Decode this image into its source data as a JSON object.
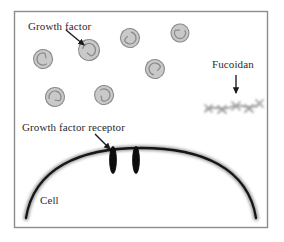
{
  "figure": {
    "frame": {
      "border_color": "#8c8c8c",
      "background_color": "#ffffff",
      "x": 14,
      "y": 11,
      "width": 254,
      "height": 217
    },
    "labels": {
      "growth_factor": "Growth factor",
      "fucoidan": "Fucoidan",
      "growth_factor_receptor": "Growth factor receptor",
      "cell": "Cell"
    },
    "colors": {
      "label_text": "#2b2b2b",
      "arrow": "#1a1a1a",
      "growth_factor_fill": "#c9c9c9",
      "growth_factor_stroke": "#8f8f8f",
      "membrane": "#1b1b1b",
      "receptor": "#111111",
      "fucoidan_chain": "#9a9a9a",
      "frame_border": "#8c8c8c"
    },
    "growth_factors": [
      {
        "id": "gf-1",
        "cx": 43,
        "cy": 59,
        "r": 9.5,
        "rotation": 20
      },
      {
        "id": "gf-2",
        "cx": 89,
        "cy": 50,
        "r": 10.5,
        "rotation": 160
      },
      {
        "id": "gf-3",
        "cx": 130,
        "cy": 38,
        "r": 9.5,
        "rotation": 250
      },
      {
        "id": "gf-4",
        "cx": 180,
        "cy": 33,
        "r": 9.0,
        "rotation": 300
      },
      {
        "id": "gf-5",
        "cx": 155,
        "cy": 69,
        "r": 9.5,
        "rotation": 70
      },
      {
        "id": "gf-6",
        "cx": 55,
        "cy": 97,
        "r": 9.5,
        "rotation": 130
      },
      {
        "id": "gf-7",
        "cx": 104,
        "cy": 95,
        "r": 9.5,
        "rotation": 200
      }
    ],
    "receptors": [
      {
        "id": "receptor-left",
        "cx": 113,
        "cy": 160,
        "rx": 3.2,
        "ry": 13
      },
      {
        "id": "receptor-right",
        "cx": 136,
        "cy": 160,
        "rx": 3.2,
        "ry": 13
      }
    ],
    "arrows": [
      {
        "id": "arrow-growth-factor",
        "x1": 66,
        "y1": 30,
        "x2": 85,
        "y2": 46
      },
      {
        "id": "arrow-fucoidan",
        "x1": 236,
        "y1": 75,
        "x2": 236,
        "y2": 95
      },
      {
        "id": "arrow-receptor",
        "x1": 95,
        "y1": 134,
        "x2": 111,
        "y2": 151
      }
    ],
    "membrane": {
      "id": "cell-membrane",
      "path": "M 26 218 C 34 168, 80 148, 141 148 C 202 148, 248 168, 256 218"
    },
    "fucoidan_chain": {
      "id": "fucoidan-molecule",
      "backbone": "M 206 110 C 214 104, 222 112, 231 107 C 240 102, 248 111, 258 105",
      "nodes": [
        {
          "x": 209,
          "y": 108
        },
        {
          "x": 222,
          "y": 110
        },
        {
          "x": 236,
          "y": 106
        },
        {
          "x": 249,
          "y": 109
        },
        {
          "x": 259,
          "y": 104
        }
      ]
    },
    "label_positions": {
      "growth_factor": {
        "x": 28,
        "y": 30
      },
      "fucoidan": {
        "x": 212,
        "y": 68
      },
      "growth_factor_receptor": {
        "x": 22,
        "y": 131
      },
      "cell": {
        "x": 40,
        "y": 204
      }
    }
  }
}
